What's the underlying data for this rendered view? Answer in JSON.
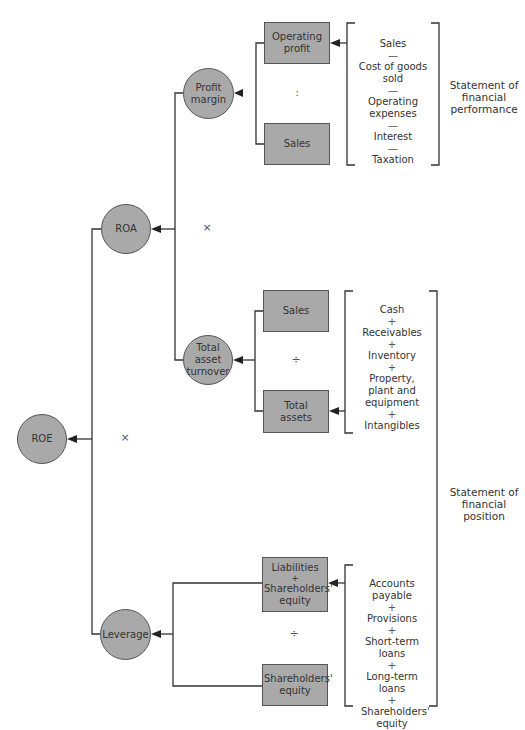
{
  "diagram": {
    "nodes": {
      "roe": "ROE",
      "roa": "ROA",
      "leverage": "Leverage",
      "profit_margin": "Profit margin",
      "total_asset_turnover": "Total asset turnover",
      "operating_profit": "Operating profit",
      "sales_pm": "Sales",
      "sales_tat": "Sales",
      "total_assets": "Total assets",
      "liabilities_plus_equity": [
        "Liabilities",
        "+",
        "Shareholders' equity"
      ],
      "shareholders_equity": "Shareholders' equity"
    },
    "operators": {
      "roe_split": "×",
      "roa_split": "×",
      "profit_margin_split": ":",
      "turnover_split": "÷",
      "leverage_split": "÷"
    },
    "brackets": {
      "performance_items": [
        {
          "term": "Sales"
        },
        {
          "sym": "—"
        },
        {
          "term": "Cost of goods sold"
        },
        {
          "sym": "—"
        },
        {
          "term": "Operating expenses"
        },
        {
          "sym": "—"
        },
        {
          "term": "Interest"
        },
        {
          "sym": "—"
        },
        {
          "term": "Taxation"
        }
      ],
      "assets_items": [
        {
          "term": "Cash"
        },
        {
          "sym": "+"
        },
        {
          "term": "Receivables"
        },
        {
          "sym": "+"
        },
        {
          "term": "Inventory"
        },
        {
          "sym": "+"
        },
        {
          "term": "Property, plant and equipment"
        },
        {
          "sym": "+"
        },
        {
          "term": "Intangibles"
        }
      ],
      "funding_items": [
        {
          "term": "Accounts payable"
        },
        {
          "sym": "+"
        },
        {
          "term": "Provisions"
        },
        {
          "sym": "+"
        },
        {
          "term": "Short-term loans"
        },
        {
          "sym": "+"
        },
        {
          "term": "Long-term loans"
        },
        {
          "sym": "+"
        },
        {
          "term": "Shareholders' equity"
        }
      ]
    },
    "statements": {
      "performance": "Statement of financial performance",
      "position": "Statement of financial position"
    },
    "colors": {
      "node_fill": "#a9a9a9",
      "stroke": "#333333",
      "text": "#333333"
    }
  }
}
